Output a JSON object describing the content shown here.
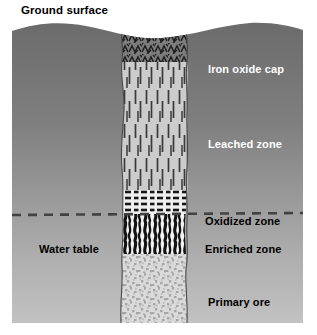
{
  "figure": {
    "title_label": "Ground surface",
    "caption_color": "#000000",
    "frame": {
      "x": 12,
      "y": 21,
      "width": 291,
      "height": 302
    },
    "background": {
      "top_color": "#6e6e6e",
      "bottom_color": "#bdbdbd",
      "description": "vertical gray gradient representing host rock"
    }
  },
  "labels": {
    "ground_surface": "Ground surface",
    "water_table": "Water table"
  },
  "water_table": {
    "label": "Water table",
    "style": "dashed",
    "color": "#3f3f3f",
    "depth_y": 215,
    "text_color": "#000000"
  },
  "ore_body": {
    "name": "ore column",
    "left_x": 120,
    "right_x": 186,
    "top_y": 23,
    "bottom_y": 323,
    "outline_color": "#4a4a4a"
  },
  "zones": [
    {
      "id": "iron-oxide-cap",
      "label": "Iron oxide cap",
      "text_color": "#ffffff",
      "fill": "#7c7c7c",
      "pattern": "zigzag-maze-hatch",
      "pattern_color": "#1f1f1f",
      "top_y": 23,
      "bottom_y": 62
    },
    {
      "id": "leached-zone",
      "label": "Leached zone",
      "text_color": "#ffffff",
      "fill": "#cfcfcf",
      "pattern": "vertical-dashes",
      "pattern_color": "#3a3a3a",
      "top_y": 62,
      "bottom_y": 190
    },
    {
      "id": "oxidized-zone",
      "label": "Oxidized zone",
      "text_color": "#000000",
      "fill": "#f0f0f0",
      "pattern": "horizontal-dashes",
      "pattern_color": "#1c1c1c",
      "top_y": 190,
      "bottom_y": 214
    },
    {
      "id": "enriched-zone",
      "label": "Enriched zone",
      "text_color": "#000000",
      "fill": "#f4f4f4",
      "pattern": "wavy-vertical-bars",
      "pattern_color": "#141414",
      "top_y": 214,
      "bottom_y": 254
    },
    {
      "id": "primary-ore",
      "label": "Primary ore",
      "text_color": "#000000",
      "fill": "#d8d8d8",
      "pattern": "stipple-speckle",
      "pattern_color": "#a8a8a8",
      "top_y": 254,
      "bottom_y": 323
    }
  ]
}
